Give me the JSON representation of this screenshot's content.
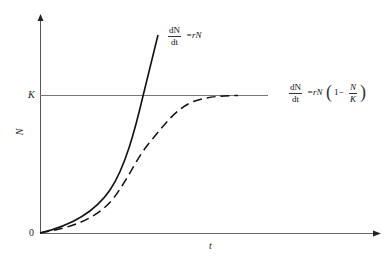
{
  "diagram": {
    "type": "population-growth-curves",
    "axes": {
      "x_label": "t",
      "y_label": "N",
      "origin_label": "0",
      "carrying_capacity_label": "K"
    },
    "curves": [
      {
        "name": "exponential",
        "style": "solid",
        "equation": {
          "numerator": "dN",
          "denominator": "dt",
          "rhs": "=rN"
        }
      },
      {
        "name": "logistic",
        "style": "dashed",
        "equation": {
          "numerator": "dN",
          "denominator": "dt",
          "rhs": "=rN",
          "open_paren": "(",
          "one_minus": "1−",
          "inner_numerator": "N",
          "inner_denominator": "K",
          "close_paren": ")"
        }
      }
    ],
    "colors": {
      "axis": "#555555",
      "curve": "#111111",
      "k_line": "#777777"
    }
  }
}
